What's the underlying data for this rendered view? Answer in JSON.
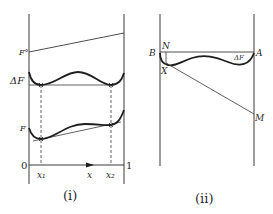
{
  "panel_i": {
    "caption": "(i)",
    "labels": {
      "f0": "F°",
      "delta_f": "ΔF",
      "f": "F",
      "origin": "0",
      "one": "1",
      "x1": "x₁",
      "x": "x",
      "x2": "x₂"
    }
  },
  "panel_ii": {
    "caption": "(ii)",
    "labels": {
      "b": "B",
      "n": "N",
      "a": "A",
      "x": "X",
      "m": "M",
      "delta_f": "ΔF"
    }
  },
  "colors": {
    "line": "#3a3a3a",
    "curve": "#1e1e1e",
    "background": "#ffffff"
  }
}
